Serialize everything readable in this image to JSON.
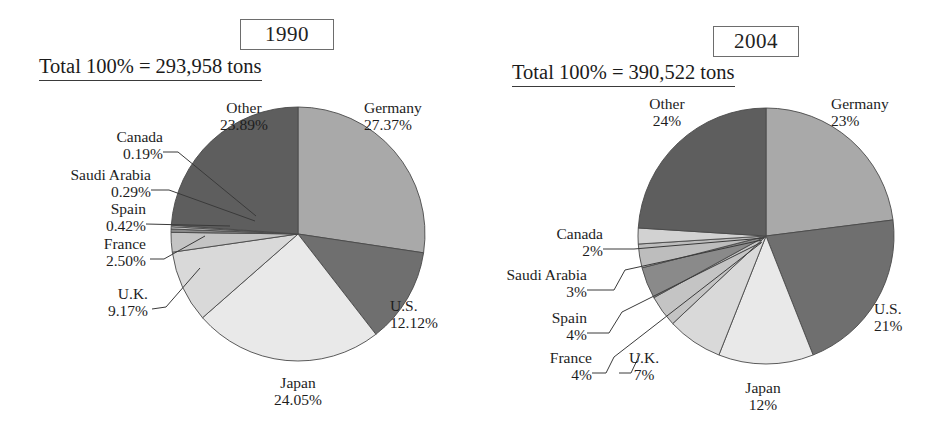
{
  "chart_data": [
    {
      "type": "pie",
      "title": "1990",
      "subtitle": "Total 100% = 293,958 tons",
      "total_label": "Total 100% = 293,958 tons",
      "total_value": 293958,
      "unit": "tons",
      "categories": [
        "Germany",
        "U.S.",
        "Japan",
        "U.K.",
        "France",
        "Spain",
        "Saudi Arabia",
        "Canada",
        "Other"
      ],
      "values": [
        27.37,
        12.12,
        24.05,
        9.17,
        2.5,
        0.42,
        0.29,
        0.19,
        23.89
      ],
      "value_labels": [
        "27.37%",
        "12.12%",
        "24.05%",
        "9.17%",
        "2.50%",
        "0.42%",
        "0.29%",
        "0.19%",
        "23.89%"
      ],
      "colors": [
        "#a9a9a9",
        "#6f6f6f",
        "#e9e9e9",
        "#d9d9d9",
        "#c4c4c4",
        "#8a8a8a",
        "#bdbdbd",
        "#d2d2d2",
        "#5e5e5e"
      ],
      "start_angle_deg": 0,
      "direction": "clockwise",
      "legend": "none",
      "grid": false
    },
    {
      "type": "pie",
      "title": "2004",
      "subtitle": "Total 100% = 390,522 tons",
      "total_label": "Total 100% = 390,522 tons",
      "total_value": 390522,
      "unit": "tons",
      "categories": [
        "Germany",
        "U.S.",
        "Japan",
        "U.K.",
        "France",
        "Spain",
        "Saudi Arabia",
        "Canada",
        "Other"
      ],
      "values": [
        23,
        21,
        12,
        7,
        4,
        4,
        3,
        2,
        24
      ],
      "value_labels": [
        "23%",
        "21%",
        "12%",
        "7%",
        "4%",
        "4%",
        "3%",
        "2%",
        "24%"
      ],
      "colors": [
        "#a9a9a9",
        "#6f6f6f",
        "#e9e9e9",
        "#d9d9d9",
        "#c4c4c4",
        "#8a8a8a",
        "#bdbdbd",
        "#d2d2d2",
        "#5e5e5e"
      ],
      "start_angle_deg": 0,
      "direction": "clockwise",
      "legend": "none",
      "grid": false
    }
  ],
  "panels": {
    "left": {
      "year": "1990",
      "total": "Total 100% = 293,958 tons",
      "labels": {
        "germany": {
          "name": "Germany",
          "pct": "27.37%"
        },
        "us": {
          "name": "U.S.",
          "pct": "12.12%"
        },
        "japan": {
          "name": "Japan",
          "pct": "24.05%"
        },
        "uk": {
          "name": "U.K.",
          "pct": "9.17%"
        },
        "france": {
          "name": "France",
          "pct": "2.50%"
        },
        "spain": {
          "name": "Spain",
          "pct": "0.42%"
        },
        "saudi": {
          "name": "Saudi Arabia",
          "pct": "0.29%"
        },
        "canada": {
          "name": "Canada",
          "pct": "0.19%"
        },
        "other": {
          "name": "Other",
          "pct": "23.89%"
        }
      }
    },
    "right": {
      "year": "2004",
      "total": "Total 100% = 390,522 tons",
      "labels": {
        "germany": {
          "name": "Germany",
          "pct": "23%"
        },
        "us": {
          "name": "U.S.",
          "pct": "21%"
        },
        "japan": {
          "name": "Japan",
          "pct": "12%"
        },
        "uk": {
          "name": "U.K.",
          "pct": "7%"
        },
        "france": {
          "name": "France",
          "pct": "4%"
        },
        "spain": {
          "name": "Spain",
          "pct": "4%"
        },
        "saudi": {
          "name": "Saudi Arabia",
          "pct": "3%"
        },
        "canada": {
          "name": "Canada",
          "pct": "2%"
        },
        "other": {
          "name": "Other",
          "pct": "24%"
        }
      }
    }
  }
}
